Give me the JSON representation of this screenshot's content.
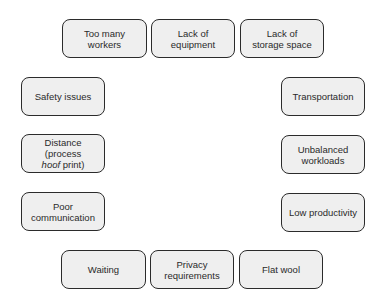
{
  "diagram": {
    "top_row": [
      {
        "label_line1": "Too many",
        "label_line2": "workers"
      },
      {
        "label_line1": "Lack of",
        "label_line2": "equipment"
      },
      {
        "label_line1": "Lack of",
        "label_line2": "storage space"
      }
    ],
    "left_column": [
      {
        "label": "Safety issues"
      },
      {
        "label_line1": "Distance (process",
        "label_line2_italic": "hoof",
        "label_line2_rest": " print)"
      },
      {
        "label_line1": "Poor",
        "label_line2": "communication"
      }
    ],
    "right_column": [
      {
        "label": "Transportation"
      },
      {
        "label_line1": "Unbalanced",
        "label_line2": "workloads"
      },
      {
        "label": "Low productivity"
      }
    ],
    "bottom_row": [
      {
        "label": "Waiting"
      },
      {
        "label_line1": "Privacy",
        "label_line2": "requirements"
      },
      {
        "label": "Flat wool"
      }
    ]
  },
  "colors": {
    "box_fill": "#efefef",
    "box_border": "#2b2b2b",
    "text": "#2a2a2a"
  }
}
